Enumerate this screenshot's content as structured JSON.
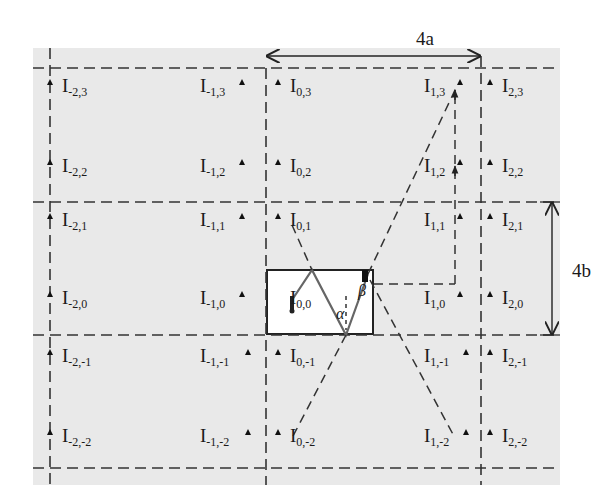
{
  "figure": {
    "dimension_labels": {
      "width": "4a",
      "height": "4b"
    },
    "angle_labels": {
      "alpha": "α",
      "beta": "β"
    },
    "images": [
      {
        "name": "I",
        "sub": "-2,3",
        "x": 62,
        "y": 88,
        "marker": "left"
      },
      {
        "name": "I",
        "sub": "-1,3",
        "x": 200,
        "y": 88,
        "marker": "right"
      },
      {
        "name": "I",
        "sub": "0,3",
        "x": 290,
        "y": 88,
        "marker": "left"
      },
      {
        "name": "I",
        "sub": "1,3",
        "x": 424,
        "y": 88,
        "marker": "right"
      },
      {
        "name": "I",
        "sub": "2,3",
        "x": 502,
        "y": 88,
        "marker": "left"
      },
      {
        "name": "I",
        "sub": "-2,2",
        "x": 62,
        "y": 168,
        "marker": "left"
      },
      {
        "name": "I",
        "sub": "-1,2",
        "x": 200,
        "y": 168,
        "marker": "right"
      },
      {
        "name": "I",
        "sub": "0,2",
        "x": 290,
        "y": 168,
        "marker": "left"
      },
      {
        "name": "I",
        "sub": "1,2",
        "x": 424,
        "y": 168,
        "marker": "right"
      },
      {
        "name": "I",
        "sub": "2,2",
        "x": 502,
        "y": 168,
        "marker": "left"
      },
      {
        "name": "I",
        "sub": "-2,1",
        "x": 62,
        "y": 222,
        "marker": "left"
      },
      {
        "name": "I",
        "sub": "-1,1",
        "x": 200,
        "y": 222,
        "marker": "right"
      },
      {
        "name": "I",
        "sub": "0,1",
        "x": 290,
        "y": 222,
        "marker": "left"
      },
      {
        "name": "I",
        "sub": "1,1",
        "x": 424,
        "y": 222,
        "marker": "right"
      },
      {
        "name": "I",
        "sub": "2,1",
        "x": 502,
        "y": 222,
        "marker": "left"
      },
      {
        "name": "I",
        "sub": "-2,0",
        "x": 62,
        "y": 300,
        "marker": "left"
      },
      {
        "name": "I",
        "sub": "-1,0",
        "x": 200,
        "y": 300,
        "marker": "right"
      },
      {
        "name": "I",
        "sub": "0,0",
        "x": 290,
        "y": 300,
        "marker": "source"
      },
      {
        "name": "I",
        "sub": "1,0",
        "x": 424,
        "y": 300,
        "marker": "right"
      },
      {
        "name": "I",
        "sub": "2,0",
        "x": 502,
        "y": 300,
        "marker": "left"
      },
      {
        "name": "I",
        "sub": "-2,-1",
        "x": 62,
        "y": 358,
        "marker": "left"
      },
      {
        "name": "I",
        "sub": "-1,-1",
        "x": 200,
        "y": 358,
        "marker": "right"
      },
      {
        "name": "I",
        "sub": "0,-1",
        "x": 290,
        "y": 358,
        "marker": "left"
      },
      {
        "name": "I",
        "sub": "1,-1",
        "x": 424,
        "y": 358,
        "marker": "right"
      },
      {
        "name": "I",
        "sub": "2,-1",
        "x": 502,
        "y": 358,
        "marker": "left"
      },
      {
        "name": "I",
        "sub": "-2,-2",
        "x": 62,
        "y": 438,
        "marker": "left"
      },
      {
        "name": "I",
        "sub": "-1,-2",
        "x": 200,
        "y": 438,
        "marker": "right"
      },
      {
        "name": "I",
        "sub": "0,-2",
        "x": 290,
        "y": 438,
        "marker": "left"
      },
      {
        "name": "I",
        "sub": "1,-2",
        "x": 424,
        "y": 438,
        "marker": "right"
      },
      {
        "name": "I",
        "sub": "2,-2",
        "x": 502,
        "y": 438,
        "marker": "left"
      }
    ]
  }
}
